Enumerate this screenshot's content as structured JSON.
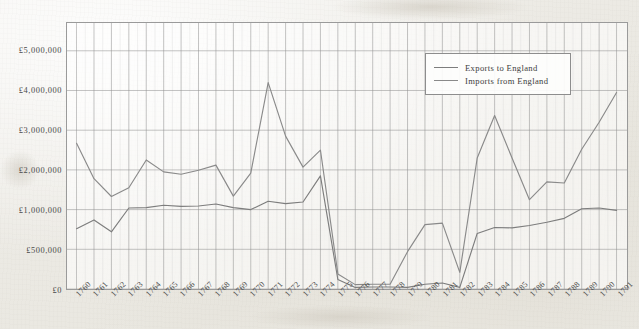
{
  "figure": {
    "axis_color": "#9a9a9a",
    "grid_major_color": "#8e8e8e",
    "grid_minor_color": "#cfcfcf",
    "text_color": "#4a4a4a"
  },
  "legend": {
    "position": "top-right",
    "entries": [
      {
        "label": "Exports to England",
        "color": "#7d7d7d",
        "swatch_name": "legend-swatch-exports"
      },
      {
        "label": "Imports from England",
        "color": "#8a8a8a",
        "swatch_name": "legend-swatch-imports"
      }
    ]
  },
  "chart_data": {
    "type": "line",
    "title": "",
    "subtitle": "",
    "xlabel": "",
    "ylabel": "",
    "grid": true,
    "legend_position": "top-right",
    "x": [
      1760,
      1761,
      1762,
      1763,
      1764,
      1765,
      1766,
      1767,
      1768,
      1769,
      1770,
      1771,
      1772,
      1773,
      1774,
      1775,
      1776,
      1777,
      1778,
      1779,
      1780,
      1781,
      1782,
      1783,
      1784,
      1785,
      1786,
      1787,
      1788,
      1789,
      1790,
      1791
    ],
    "categories": [
      "1760",
      "1761",
      "1762",
      "1763",
      "1764",
      "1765",
      "1766",
      "1767",
      "1768",
      "1769",
      "1770",
      "1771",
      "1772",
      "1773",
      "1774",
      "1775",
      "1776",
      "1777",
      "1778",
      "1779",
      "1780",
      "1781",
      "1782",
      "1783",
      "1784",
      "1785",
      "1786",
      "1787",
      "1788",
      "1789",
      "1790",
      "1791"
    ],
    "xlim": [
      1760,
      1791
    ],
    "ylim": [
      0,
      5600000
    ],
    "y_ticks": [
      0,
      500000,
      1000000,
      2000000,
      3000000,
      4000000,
      5000000
    ],
    "y_tick_labels": [
      "£0",
      "£500,000",
      "£1,000,000",
      "£2,000,000",
      "£3,000,000",
      "£4,000,000",
      "£5,000,000"
    ],
    "y_scale_note": "piecewise: £0–£500,000 then £500,000–£5,000,000 in £1,000,000 steps, evenly spaced",
    "series": [
      {
        "name": "Exports to England",
        "color": "#7d7d7d",
        "values": [
          760000,
          870000,
          720000,
          1040000,
          1050000,
          1110000,
          1080000,
          1090000,
          1140000,
          1050000,
          1000000,
          1210000,
          1150000,
          1190000,
          1850000,
          120000,
          20000,
          25000,
          25000,
          20000,
          60000,
          75000,
          20000,
          700000,
          775000,
          770000,
          800000,
          840000,
          890000,
          1020000,
          1040000,
          990000
        ]
      },
      {
        "name": "Imports from England",
        "color": "#8a8a8a",
        "values": [
          2670000,
          1780000,
          1330000,
          1550000,
          2250000,
          1950000,
          1890000,
          1990000,
          2120000,
          1340000,
          1920000,
          4200000,
          2850000,
          2070000,
          2500000,
          190000,
          55000,
          60000,
          60000,
          470000,
          810000,
          830000,
          210000,
          2300000,
          3370000,
          2300000,
          1250000,
          1700000,
          1670000,
          2520000,
          3200000,
          3950000
        ]
      }
    ]
  }
}
